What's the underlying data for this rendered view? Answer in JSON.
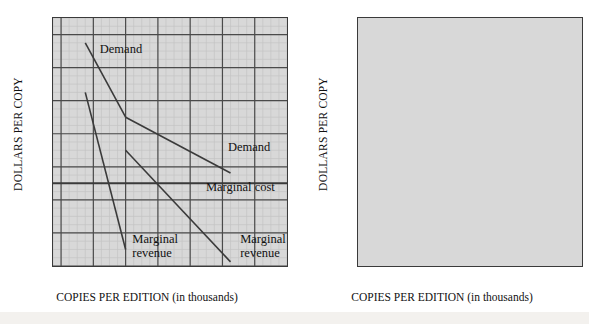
{
  "figure": {
    "background_color": "#ffffff",
    "plot_background_color": "#d8d8d8",
    "grid_major_color": "#4a4a4a",
    "grid_minor_color": "#c3c3c3",
    "line_color": "#3a3a3a"
  },
  "axis": {
    "y_title": "DOLLARS PER COPY",
    "x_title_caps": "COPIES PER EDITION",
    "x_title_paren": "(in thousands)",
    "y_ticks": [
      "$40",
      "32",
      "24",
      "16",
      "8",
      "0",
      "−8",
      "−16"
    ],
    "y_tick_values": [
      40,
      32,
      24,
      16,
      8,
      0,
      -8,
      -16
    ],
    "x_ticks": [
      "0",
      "8",
      "16",
      "24",
      "32",
      "40",
      "48"
    ],
    "x_tick_values": [
      0,
      8,
      16,
      24,
      32,
      40,
      48
    ],
    "ylim": [
      -16,
      44
    ],
    "xlim": [
      -2,
      56
    ],
    "minor_step_x": 2,
    "minor_step_y": 2
  },
  "chart_data": [
    {
      "type": "line",
      "panel": "left",
      "title": "",
      "xlabel": "COPIES PER EDITION (in thousands)",
      "ylabel": "DOLLARS PER COPY",
      "xlim": [
        -2,
        56
      ],
      "ylim": [
        -16,
        44
      ],
      "grid": true,
      "legend": "none",
      "series": [
        {
          "name": "Demand (hardcover segment)",
          "label": "Demand",
          "points": [
            [
              6,
              38
            ],
            [
              16,
              20
            ]
          ]
        },
        {
          "name": "Demand (softcover segment)",
          "label": "Demand",
          "points": [
            [
              16,
              20
            ],
            [
              42,
              6.5
            ]
          ]
        },
        {
          "name": "Marginal revenue (upper segment)",
          "label": "Marginal revenue",
          "points": [
            [
              6,
              26
            ],
            [
              16,
              -12
            ]
          ]
        },
        {
          "name": "Marginal revenue (lower segment)",
          "label": "Marginal revenue",
          "points": [
            [
              16,
              12
            ],
            [
              42,
              -15
            ]
          ]
        },
        {
          "name": "Marginal cost",
          "label": "Marginal cost",
          "points": [
            [
              -2,
              4
            ],
            [
              56,
              4
            ]
          ]
        }
      ],
      "annotations": [
        {
          "text": "Demand",
          "x": 9.5,
          "y": 36.5,
          "align": "left"
        },
        {
          "text": "Demand",
          "x": 41,
          "y": 13,
          "align": "left"
        },
        {
          "text": "Marginal cost",
          "x": 53,
          "y": 3.4,
          "align": "right"
        },
        {
          "text": "Marginal\nrevenue",
          "x": 17.5,
          "y": -9,
          "align": "left"
        },
        {
          "text": "Marginal\nrevenue",
          "x": 44,
          "y": -9,
          "align": "left"
        }
      ]
    },
    {
      "type": "line",
      "panel": "right",
      "title": "",
      "xlabel": "COPIES PER EDITION (in thousands)",
      "ylabel": "DOLLARS PER COPY",
      "xlim": [
        -2,
        56
      ],
      "ylim": [
        -16,
        44
      ],
      "grid": true,
      "legend": "none",
      "series": [
        {
          "name": "Demand for hardcover edition",
          "label": "Demand for hardcover edition",
          "points": [
            [
              6,
              38
            ],
            [
              16,
              20
            ]
          ]
        },
        {
          "name": "Demand for softcover edition",
          "label": "Demand for softcover edition",
          "points": [
            [
              0,
              19
            ],
            [
              26,
              6.5
            ]
          ]
        },
        {
          "name": "Marginal cost",
          "label": "Marginal cost",
          "points": [
            [
              -2,
              4
            ],
            [
              56,
              4
            ]
          ]
        }
      ],
      "annotations": [
        {
          "text": "Demand for\nhardcover edition",
          "x": 10,
          "y": 38,
          "align": "left"
        },
        {
          "text": "Demand for\nsoftcover edition",
          "x": 26,
          "y": 14,
          "align": "left"
        },
        {
          "text": "Marginal cost",
          "x": 53,
          "y": 3.4,
          "align": "right"
        }
      ]
    }
  ],
  "panels": {
    "left": {
      "annotations": {
        "demand_upper": "Demand",
        "demand_lower": "Demand",
        "marginal_cost": "Marginal cost",
        "marginal_revenue_left": "Marginal\nrevenue",
        "marginal_revenue_right": "Marginal\nrevenue"
      }
    },
    "right": {
      "annotations": {
        "demand_hardcover": "Demand for\nhardcover edition",
        "demand_softcover": "Demand for\nsoftcover edition",
        "marginal_cost": "Marginal cost"
      }
    }
  }
}
